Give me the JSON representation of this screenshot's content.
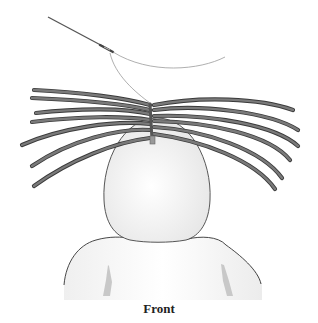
{
  "figure": {
    "caption": "Front",
    "elements": [
      "needle",
      "thread",
      "hair-wefts",
      "head",
      "shoulders"
    ],
    "colors": {
      "strand": "#6a6a6a",
      "strand_outline": "#3a3a3a",
      "head_fill": "#f2f2f2",
      "outline": "#444444",
      "thread": "#999999"
    }
  }
}
